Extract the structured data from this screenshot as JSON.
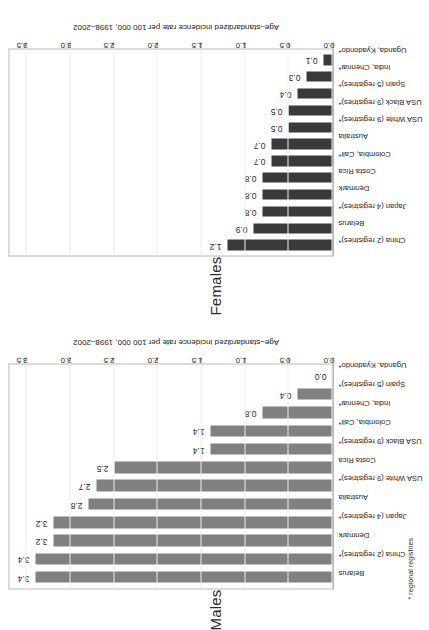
{
  "figure": {
    "footnote": "* regional registries",
    "bar_color_females": "#3a3a3a",
    "bar_color_males": "#808080",
    "axis_title": "Age–standardized incidence rate per 100 000, 1998–2002"
  },
  "panels": {
    "females": {
      "title": "Females",
      "axis_title": "Age–standardized incidence rate per 100 000, 1998–2002"
    },
    "males": {
      "title": "Males",
      "axis_title": "Age–standardized incidence rate per 100 000, 1998–2002"
    }
  },
  "axis": {
    "ticks": [
      "0.0",
      "0.5",
      "1.0",
      "1.5",
      "2.0",
      "2.5",
      "3.0",
      "3.5"
    ]
  },
  "chart_data": [
    {
      "type": "bar",
      "title": "Females",
      "xlabel": "",
      "ylabel": "Age–standardized incidence rate per 100 000, 1998–2002",
      "ylim": [
        0,
        3.7
      ],
      "grid": true,
      "legend": "none",
      "orientation": "vertical-rotated-90ccw",
      "yticks": [
        0.0,
        0.5,
        1.0,
        1.5,
        2.0,
        2.5,
        3.0,
        3.5
      ],
      "categories": [
        "China (2 registries)*",
        "Belarus",
        "Japan (4 registries)*",
        "Denmark",
        "Costa Rica",
        "Colombia, Cali*",
        "Australia",
        "USA White (9 registries)*",
        "USA Black (9 registries)*",
        "Spain (5 registries)*",
        "India, Chennai*",
        "Uganda, Kyadondo*"
      ],
      "values": [
        1.2,
        0.9,
        0.8,
        0.8,
        0.8,
        0.7,
        0.7,
        0.5,
        0.5,
        0.4,
        0.3,
        0.1
      ],
      "value_labels": [
        "1.2",
        "0.9",
        "0.8",
        "0.8",
        "0.8",
        "0.7",
        "0.7",
        "0.5",
        "0.5",
        "0.4",
        "0.3",
        "0.1"
      ]
    },
    {
      "type": "bar",
      "title": "Males",
      "xlabel": "",
      "ylabel": "Age–standardized incidence rate per 100 000, 1998–2002",
      "ylim": [
        0,
        3.7
      ],
      "grid": true,
      "legend": "none",
      "orientation": "vertical-rotated-90ccw",
      "yticks": [
        0.0,
        0.5,
        1.0,
        1.5,
        2.0,
        2.5,
        3.0,
        3.5
      ],
      "categories": [
        "Belarus",
        "China (2 registries)*",
        "Denmark",
        "Japan (4 registries)*",
        "Australia",
        "USA White (9 registries)*",
        "Costa Rica",
        "USA Black (9 registries)*",
        "Colombia, Cali*",
        "India, Chennai*",
        "Spain (5 registries)*",
        "Uganda, Kyadondo*"
      ],
      "values": [
        3.4,
        3.4,
        3.2,
        3.2,
        2.8,
        2.7,
        2.5,
        1.4,
        1.4,
        0.8,
        0.4,
        0.0
      ],
      "value_labels": [
        "3.4",
        "3.4",
        "3.2",
        "3.2",
        "2.8",
        "2.7",
        "2.5",
        "1.4",
        "1.4",
        "0.8",
        "0.4",
        "0.0"
      ]
    }
  ]
}
